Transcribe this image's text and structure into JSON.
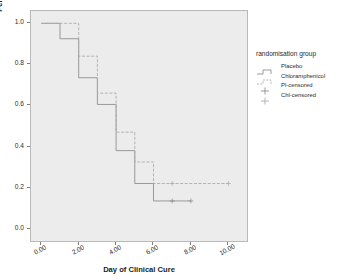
{
  "chart_data": {
    "type": "line",
    "subtype": "kaplan-meier-step",
    "title": "",
    "xlabel": "Day of Clinical Cure",
    "ylabel": "Percentage with Conjunctivitis",
    "xlim": [
      -0.55,
      11.0
    ],
    "ylim": [
      -0.06,
      1.06
    ],
    "xticks": [
      0,
      2,
      4,
      6,
      8,
      10
    ],
    "xticklabels": [
      "0.00",
      "2.00",
      "4.00",
      "6.00",
      "8.00",
      "10.00"
    ],
    "yticks": [
      0.0,
      0.2,
      0.4,
      0.6,
      0.8,
      1.0
    ],
    "yticklabels": [
      "0.0",
      "0.2",
      "0.4",
      "0.6",
      "0.8",
      "1.0"
    ],
    "grid": false,
    "legend_position": "right",
    "panel_color": "#ececec",
    "series": [
      {
        "name": "Placebo",
        "style": "solid",
        "color": "#909090",
        "x": [
          0,
          1,
          1,
          2,
          2,
          3,
          3,
          4,
          4,
          5,
          5,
          6,
          6,
          8
        ],
        "y": [
          1.0,
          1.0,
          0.925,
          0.925,
          0.735,
          0.735,
          0.605,
          0.605,
          0.38,
          0.38,
          0.22,
          0.22,
          0.135,
          0.135
        ],
        "censored_x": [
          7,
          8
        ],
        "censored_y": [
          0.135,
          0.135
        ]
      },
      {
        "name": "Chloramphenicol",
        "style": "dashed",
        "color": "#adadad",
        "x": [
          0,
          2,
          2,
          3,
          3,
          4,
          4,
          5,
          5,
          6,
          6,
          10
        ],
        "y": [
          1.0,
          1.0,
          0.84,
          0.84,
          0.66,
          0.66,
          0.47,
          0.47,
          0.325,
          0.325,
          0.22,
          0.22
        ],
        "censored_x": [
          7,
          10
        ],
        "censored_y": [
          0.22,
          0.22
        ]
      }
    ]
  },
  "legend": {
    "title": "randomisation group",
    "items": [
      {
        "label": "Placebo",
        "marker": "step-solid"
      },
      {
        "label": "Chloramphenicol",
        "marker": "step-dashed"
      },
      {
        "label": "Pl-censored",
        "marker": "plus"
      },
      {
        "label": "Chl-censored",
        "marker": "plus"
      }
    ]
  },
  "axes": {
    "x": {
      "label": "Day of Clinical Cure",
      "ticklabels": [
        "0.00",
        "2.00",
        "4.00",
        "6.00",
        "8.00",
        "10.00"
      ]
    },
    "y": {
      "label": "Percentage with Conjunctivitis",
      "ticklabels": [
        "0.0",
        "0.2",
        "0.4",
        "0.6",
        "0.8",
        "1.0"
      ]
    }
  }
}
